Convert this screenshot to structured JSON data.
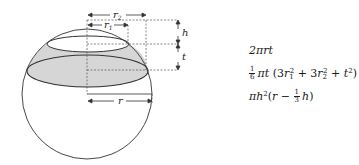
{
  "diagram": {
    "labels": {
      "r2": "r",
      "r2_sub": "2",
      "r1": "r",
      "r1_sub": "1",
      "h": "h",
      "t": "t",
      "r": "r"
    },
    "colors": {
      "outline": "#333333",
      "shaded_zone": "#d6d6d6",
      "dashes": "#555555"
    }
  },
  "formulas": {
    "zone_area": {
      "text": "2πrt"
    },
    "segment_volume": {
      "frac_num": "1",
      "frac_den": "6",
      "pre": "πt",
      "paren_open": "(3r",
      "sub1": "1",
      "sup1": "2",
      "mid": " + 3r",
      "sub2": "2",
      "sup2": "2",
      "end": " + t",
      "sup3": "2",
      "paren_close": ")"
    },
    "cap_volume": {
      "pre": "πh",
      "sup": "2",
      "mid": "(r − ",
      "frac_num": "1",
      "frac_den": "3",
      "end": "h)"
    }
  }
}
